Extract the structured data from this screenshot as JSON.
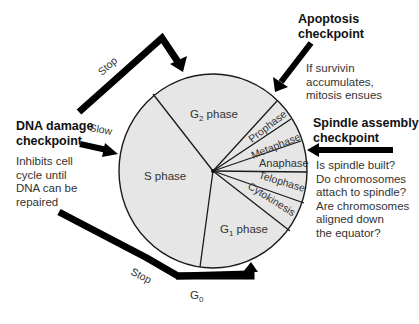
{
  "diagram": {
    "phases": [
      {
        "id": "g2",
        "label_main": "G",
        "label_sub": "2",
        "label_rest": " phase"
      },
      {
        "id": "prophase",
        "label": "Prophase"
      },
      {
        "id": "metaphase",
        "label": "Metaphase"
      },
      {
        "id": "anaphase",
        "label": "Anaphase"
      },
      {
        "id": "telophase",
        "label": "Telophase"
      },
      {
        "id": "cytokinesis",
        "label": "Cytokinesis"
      },
      {
        "id": "g1",
        "label_main": "G",
        "label_sub": "1",
        "label_rest": " phase"
      },
      {
        "id": "s",
        "label": "S phase"
      }
    ],
    "g0": {
      "main": "G",
      "sub": "0"
    },
    "arrows": {
      "top_stop": "Stop",
      "slow": "Slow",
      "bottom_stop": "Stop"
    },
    "checkpoints": {
      "dna_damage": {
        "title_line1": "DNA damage",
        "title_line2": "checkpoint",
        "desc": [
          "Inhibits cell",
          "cycle until",
          "DNA can be",
          "repaired"
        ]
      },
      "apoptosis": {
        "title_line1": "Apoptosis",
        "title_line2": "checkpoint",
        "desc": [
          "If survivin",
          "accumulates,",
          "mitosis ensues"
        ]
      },
      "spindle_assembly": {
        "title_line1": "Spindle assembly",
        "title_line2": "checkpoint",
        "desc": [
          "Is spindle built?",
          "Do chromosomes",
          "attach to spindle?",
          "Are chromosomes",
          "aligned down",
          "the equator?"
        ]
      }
    },
    "colors": {
      "wedge_fill": "#e6e6e6",
      "outline": "#1a1a1a",
      "arrow": "#000000",
      "text": "#333333"
    }
  }
}
